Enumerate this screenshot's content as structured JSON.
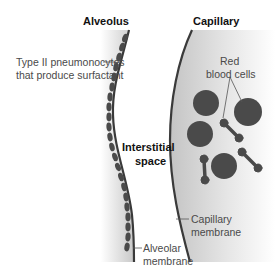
{
  "diagram": {
    "type": "anatomical cross-section",
    "headings": {
      "alveolus": "Alveolus",
      "capillary": "Capillary"
    },
    "labels": {
      "type2_line1": "Type II pneumonocytes",
      "type2_line2": "that produce surfactant",
      "interstitial_line1": "Interstitial",
      "interstitial_line2": "space",
      "rbc_line1": "Red",
      "rbc_line2": "blood cells",
      "capmem_line1": "Capillary",
      "capmem_line2": "membrane",
      "alvmem_line1": "Alveolar",
      "alvmem_line2": "membrane"
    },
    "colors": {
      "membrane": "#3a3a3a",
      "cells": "#4a4a4a",
      "shading": "#cfcfcf",
      "label_text": "#4a4a4a",
      "heading_text": "#111111"
    },
    "elements": {
      "red_blood_cells_faceon": 5,
      "red_blood_cells_sideview": 4,
      "type2_cells": 22
    }
  }
}
